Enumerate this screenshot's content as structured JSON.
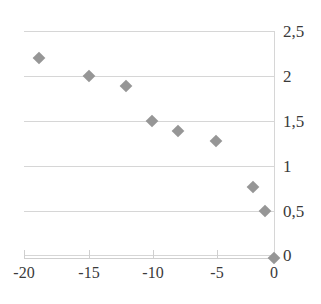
{
  "chart_data": {
    "type": "scatter",
    "title": "",
    "xlabel": "",
    "ylabel": "",
    "xlim": [
      -20.5,
      0.5
    ],
    "ylim": [
      0,
      2.5
    ],
    "grid": true,
    "legend": false,
    "marker_color": "#969696",
    "marker_shape": "diamond",
    "gridline_color": "#d6d6d6",
    "axis_color": "#cfcfcf",
    "text_color": "#3a3a3a",
    "decimal_separator": ",",
    "x_ticks": [
      -20,
      -15,
      -10,
      -5,
      0
    ],
    "x_tick_labels": [
      "-20",
      "-15",
      "-10",
      "-5",
      "0"
    ],
    "y_ticks": [
      0,
      0.5,
      1,
      1.5,
      2,
      2.5
    ],
    "y_tick_labels": [
      "0",
      "0,5",
      "1",
      "1,5",
      "2",
      "2,5"
    ],
    "points": [
      {
        "x": -19,
        "y": 2.2,
        "px": 39,
        "py": 58
      },
      {
        "x": -15,
        "y": 2.0,
        "px": 89,
        "py": 76
      },
      {
        "x": -12,
        "y": 1.93,
        "px": 126,
        "py": 86
      },
      {
        "x": -10,
        "y": 1.5,
        "px": 152,
        "py": 121
      },
      {
        "x": -8,
        "y": 1.4,
        "px": 178,
        "py": 131
      },
      {
        "x": -5,
        "y": 1.3,
        "px": 216,
        "py": 141
      },
      {
        "x": -2,
        "y": 0.8,
        "px": 253,
        "py": 187
      },
      {
        "x": -1,
        "y": 0.5,
        "px": 265,
        "py": 211
      },
      {
        "x": 0,
        "y": 0.0,
        "px": 274,
        "py": 258
      }
    ],
    "gridline_pixels": [
      {
        "value": 2.5,
        "py": 31
      },
      {
        "value": 2.0,
        "py": 76
      },
      {
        "value": 1.5,
        "py": 121
      },
      {
        "value": 1.0,
        "py": 166
      },
      {
        "value": 0.5,
        "py": 211
      },
      {
        "value": 0.0,
        "py": 255
      }
    ],
    "xtick_pixels": [
      {
        "value": -20,
        "px": 24
      },
      {
        "value": -15,
        "px": 89
      },
      {
        "value": -10,
        "px": 153
      },
      {
        "value": -5,
        "px": 217
      },
      {
        "value": 0,
        "px": 274
      }
    ]
  }
}
